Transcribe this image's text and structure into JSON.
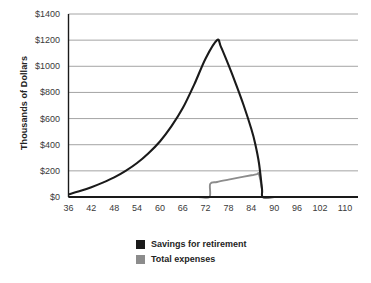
{
  "chart_data": {
    "type": "line",
    "title": "",
    "xlabel": "",
    "ylabel": "Thousands of Dollars",
    "xlim": [
      36,
      112
    ],
    "ylim": [
      0,
      1400
    ],
    "grid": true,
    "legend_position": "bottom",
    "x_tick_labels": [
      "36",
      "42",
      "48",
      "54",
      "60",
      "66",
      "72",
      "78",
      "84",
      "90",
      "96",
      "102",
      "110"
    ],
    "x_tick_values": [
      36,
      42,
      48,
      54,
      60,
      66,
      72,
      78,
      84,
      90,
      96,
      102,
      110
    ],
    "y_tick_labels": [
      "$0",
      "$200",
      "$400",
      "$600",
      "$800",
      "$1000",
      "$1200",
      "$1400"
    ],
    "y_tick_values": [
      0,
      200,
      400,
      600,
      800,
      1000,
      1200,
      1400
    ],
    "series": [
      {
        "name": "Savings for retirement",
        "color": "#1a1a1a",
        "x": [
          36,
          39,
          42,
          45,
          48,
          51,
          54,
          57,
          60,
          63,
          66,
          69,
          72,
          75,
          76,
          78,
          80,
          82,
          84,
          85,
          86,
          86.8,
          87,
          90,
          96,
          102,
          110
        ],
        "values": [
          20,
          45,
          75,
          110,
          150,
          200,
          260,
          335,
          425,
          540,
          680,
          860,
          1060,
          1200,
          1150,
          1010,
          860,
          700,
          520,
          410,
          260,
          60,
          0,
          0,
          0,
          0,
          0
        ]
      },
      {
        "name": "Total expenses",
        "color": "#8c8c8c",
        "x": [
          36,
          60,
          70,
          73,
          73.2,
          75,
          78,
          81,
          84,
          85.5,
          86,
          86.8,
          87,
          90,
          96,
          102,
          110
        ],
        "values": [
          0,
          0,
          0,
          0,
          100,
          115,
          133,
          150,
          166,
          175,
          175,
          60,
          0,
          0,
          0,
          0,
          0
        ]
      }
    ]
  },
  "legend": {
    "items": [
      {
        "label": "Savings for retirement",
        "color": "#1a1a1a"
      },
      {
        "label": "Total expenses",
        "color": "#8c8c8c"
      }
    ]
  },
  "axes": {
    "y_title": "Thousands of Dollars"
  },
  "colors": {
    "gridline": "#9a9a9a",
    "axis": "#1a1a1a",
    "background": "#ffffff",
    "savings": "#1a1a1a",
    "expenses": "#8c8c8c"
  }
}
